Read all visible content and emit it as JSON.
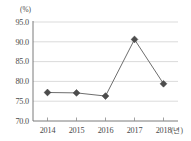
{
  "chart_data": {
    "type": "line",
    "title": "",
    "subtitle": "",
    "xlabel": "(년)",
    "ylabel": "(%)",
    "categories": [
      "2014",
      "2015",
      "2016",
      "2017",
      "2018"
    ],
    "values": [
      77.2,
      77.1,
      76.3,
      90.6,
      79.4
    ],
    "series": [
      {
        "name": "",
        "values": [
          77.2,
          77.1,
          76.3,
          90.6,
          79.4
        ]
      }
    ],
    "ylim": [
      70.0,
      95.0
    ],
    "ytick_labels": [
      "95.0",
      "90.0",
      "85.0",
      "80.0",
      "75.0",
      "70.0"
    ],
    "ytick_values": [
      95.0,
      90.0,
      85.0,
      80.0,
      75.0,
      70.0
    ],
    "xtick_labels": [
      "2014",
      "2015",
      "2016",
      "2017",
      "2018"
    ],
    "grid": "horizontal",
    "legend": "none",
    "marker": "diamond",
    "colors": {
      "line": "#6e6e6e",
      "marker": "#4d4d4d",
      "grid": "#cccccc",
      "axis": "#6b6b6b",
      "text": "#4a4a4a",
      "background": "#ffffff"
    }
  },
  "axes": {
    "y_unit_label": "(%)",
    "x_unit_label": "(년)",
    "y_ticks": [
      {
        "label": "95.0"
      },
      {
        "label": "90.0"
      },
      {
        "label": "85.0"
      },
      {
        "label": "80.0"
      },
      {
        "label": "75.0"
      },
      {
        "label": "70.0"
      }
    ],
    "x_ticks": [
      {
        "label": "2014"
      },
      {
        "label": "2015"
      },
      {
        "label": "2016"
      },
      {
        "label": "2017"
      },
      {
        "label": "2018"
      }
    ]
  }
}
